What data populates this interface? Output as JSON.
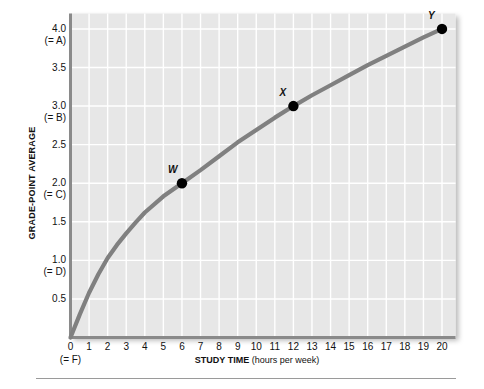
{
  "chart_data": {
    "type": "line",
    "title": "",
    "xlabel": "STUDY TIME (hours per week)",
    "xlabel_bold": "STUDY TIME",
    "xlabel_rest": " (hours per week)",
    "ylabel": "GRADE-POINT AVERAGE",
    "xlim": [
      0,
      20
    ],
    "ylim": [
      0,
      4.2
    ],
    "grid": true,
    "legend": "none",
    "line_color": "#808080",
    "plot_background": "#e7e7e7",
    "gridline_color": "#ffffff",
    "axis_color": "#8a8a8a",
    "marker_color": "#000000",
    "x_ticks": [
      {
        "value": 0,
        "label": "0",
        "grade": "(= F)"
      },
      {
        "value": 1,
        "label": "1"
      },
      {
        "value": 2,
        "label": "2"
      },
      {
        "value": 3,
        "label": "3"
      },
      {
        "value": 4,
        "label": "4"
      },
      {
        "value": 5,
        "label": "5"
      },
      {
        "value": 6,
        "label": "6"
      },
      {
        "value": 7,
        "label": "7"
      },
      {
        "value": 8,
        "label": "8"
      },
      {
        "value": 9,
        "label": "9"
      },
      {
        "value": 10,
        "label": "10"
      },
      {
        "value": 11,
        "label": "11"
      },
      {
        "value": 12,
        "label": "12"
      },
      {
        "value": 13,
        "label": "13"
      },
      {
        "value": 14,
        "label": "14"
      },
      {
        "value": 15,
        "label": "15"
      },
      {
        "value": 16,
        "label": "16"
      },
      {
        "value": 17,
        "label": "17"
      },
      {
        "value": 18,
        "label": "18"
      },
      {
        "value": 19,
        "label": "19"
      },
      {
        "value": 20,
        "label": "20"
      }
    ],
    "y_ticks": [
      {
        "value": 4.0,
        "label": "4.0",
        "grade": "(= A)"
      },
      {
        "value": 3.5,
        "label": "3.5",
        "grade": ""
      },
      {
        "value": 3.0,
        "label": "3.0",
        "grade": "(= B)"
      },
      {
        "value": 2.5,
        "label": "2.5",
        "grade": ""
      },
      {
        "value": 2.0,
        "label": "2.0",
        "grade": "(= C)"
      },
      {
        "value": 1.5,
        "label": "1.5",
        "grade": ""
      },
      {
        "value": 1.0,
        "label": "1.0",
        "grade": "(= D)"
      },
      {
        "value": 0.5,
        "label": "0.5",
        "grade": ""
      },
      {
        "value": 0.0,
        "label": "0",
        "grade": "(= F)"
      }
    ],
    "curve": [
      {
        "x": 0.0,
        "y": 0.0
      },
      {
        "x": 0.5,
        "y": 0.3
      },
      {
        "x": 1.0,
        "y": 0.58
      },
      {
        "x": 1.5,
        "y": 0.82
      },
      {
        "x": 2.0,
        "y": 1.03
      },
      {
        "x": 2.5,
        "y": 1.2
      },
      {
        "x": 3.0,
        "y": 1.35
      },
      {
        "x": 3.5,
        "y": 1.49
      },
      {
        "x": 4.0,
        "y": 1.62
      },
      {
        "x": 5.0,
        "y": 1.83
      },
      {
        "x": 6.0,
        "y": 2.0
      },
      {
        "x": 7.0,
        "y": 2.17
      },
      {
        "x": 8.0,
        "y": 2.35
      },
      {
        "x": 9.0,
        "y": 2.53
      },
      {
        "x": 10.0,
        "y": 2.69
      },
      {
        "x": 11.0,
        "y": 2.85
      },
      {
        "x": 12.0,
        "y": 3.0
      },
      {
        "x": 13.0,
        "y": 3.14
      },
      {
        "x": 14.0,
        "y": 3.27
      },
      {
        "x": 15.0,
        "y": 3.4
      },
      {
        "x": 16.0,
        "y": 3.53
      },
      {
        "x": 17.0,
        "y": 3.65
      },
      {
        "x": 18.0,
        "y": 3.77
      },
      {
        "x": 19.0,
        "y": 3.89
      },
      {
        "x": 20.0,
        "y": 4.0
      }
    ],
    "points": [
      {
        "label": "W",
        "x": 6,
        "y": 2.0
      },
      {
        "label": "X",
        "x": 12,
        "y": 3.0
      },
      {
        "label": "Y",
        "x": 20,
        "y": 4.0
      }
    ]
  }
}
